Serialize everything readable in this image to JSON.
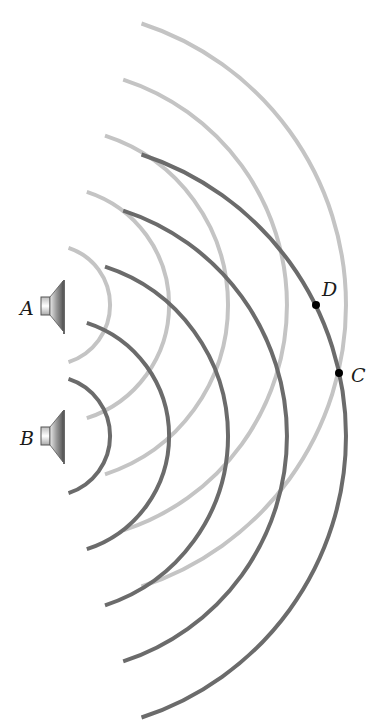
{
  "figure": {
    "speakers": [
      {
        "id": "A",
        "label": "A",
        "cx": 50,
        "cy": 305,
        "wave_color": "#c4c4c4"
      },
      {
        "id": "B",
        "label": "B",
        "cx": 50,
        "cy": 436,
        "wave_color": "#6b6b6b"
      }
    ],
    "wavefront_radii": [
      60,
      119,
      178,
      237,
      296
    ],
    "arc_half_angle_deg": 72,
    "points": [
      {
        "id": "D",
        "label": "D",
        "x": 316,
        "y": 305
      },
      {
        "id": "C",
        "label": "C",
        "x": 339,
        "y": 373
      }
    ],
    "colors": {
      "light_wave": "#c4c4c4",
      "dark_wave": "#6b6b6b",
      "point": "#000000",
      "text": "#1a1a1a"
    }
  }
}
